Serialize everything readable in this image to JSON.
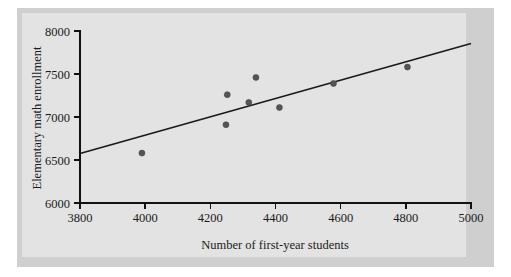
{
  "figure": {
    "background_outer": "#cfcfcf",
    "background_plate": "#e3e3e3",
    "point_color": "#555555",
    "line_color": "#1a1a1a"
  },
  "chart_data": {
    "type": "scatter",
    "title": "",
    "subtitle": "",
    "xlabel": "Number of first-year students",
    "ylabel": "Elementary math enrollment",
    "xlim": [
      3800,
      5000
    ],
    "ylim": [
      6000,
      8000
    ],
    "xticks": [
      3800,
      4000,
      4200,
      4400,
      4600,
      4800,
      5000
    ],
    "xticklabels": [
      "3800",
      "4000",
      "4200",
      "4400",
      "4600",
      "4800",
      "5000"
    ],
    "yticks": [
      6000,
      6500,
      7000,
      7500,
      8000
    ],
    "yticklabels": [
      "6000",
      "6500",
      "7000",
      "7500",
      "8000"
    ],
    "grid": false,
    "legend": null,
    "x": [
      3990,
      4248,
      4252,
      4318,
      4340,
      4412,
      4578,
      4805
    ],
    "y": [
      6580,
      6910,
      7260,
      7170,
      7460,
      7110,
      7390,
      7580
    ],
    "points": [
      {
        "x": 3990,
        "y": 6580
      },
      {
        "x": 4248,
        "y": 6910
      },
      {
        "x": 4252,
        "y": 7260
      },
      {
        "x": 4318,
        "y": 7170
      },
      {
        "x": 4340,
        "y": 7460
      },
      {
        "x": 4412,
        "y": 7110
      },
      {
        "x": 4578,
        "y": 7390
      },
      {
        "x": 4805,
        "y": 7580
      }
    ],
    "trend_line": {
      "x0": 3800,
      "y0": 6575,
      "x1": 5000,
      "y1": 7855
    },
    "marker": "filled-circle",
    "marker_size": 3
  }
}
